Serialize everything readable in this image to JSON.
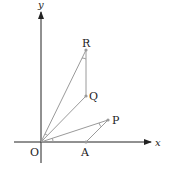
{
  "diagram": {
    "axes": {
      "x_label": "x",
      "y_label": "y",
      "origin_label": "O"
    },
    "points": [
      {
        "name": "A",
        "label": "A"
      },
      {
        "name": "P",
        "label": "P"
      },
      {
        "name": "Q",
        "label": "Q"
      },
      {
        "name": "R",
        "label": "R"
      }
    ],
    "segments": [
      "OA",
      "OP",
      "AP",
      "OQ",
      "OR",
      "QR"
    ],
    "colors": {
      "axis": "#222222",
      "segment": "#9a9a9a",
      "point": "#9a9a9a"
    }
  }
}
